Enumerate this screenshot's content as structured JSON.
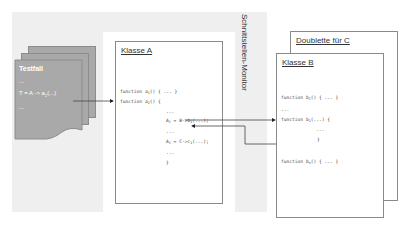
{
  "diagram": {
    "monitor_label": "Schnittstellen-Monitor",
    "testfall": {
      "title": "Testfall",
      "lines": [
        "...",
        "T = A -> a",
        "2",
        "(...)",
        "..."
      ]
    },
    "klasse_a": {
      "title": "Klasse A",
      "code": {
        "f1": "function a",
        "f1_sub": "1",
        "f1_rest": "() { ... }",
        "f2": "function a",
        "f2_sub": "2",
        "f2_rest": "() {",
        "dots1": "...",
        "l1a": "A",
        "l1_sub": "1",
        "l1b": " = B->b",
        "l1_sub2": "1",
        "l1c": "(...);",
        "dots2": "...",
        "l2a": "A",
        "l2_sub": "1",
        "l2b": " = C->c",
        "l2_sub2": "1",
        "l2c": "(...);",
        "dots3": "...",
        "close": "}"
      }
    },
    "doublette": {
      "title": "Doublette für C"
    },
    "klasse_b": {
      "title": "Klasse B",
      "code": {
        "f1": "function b",
        "f1_sub": "1",
        "f1_rest": "() { ... }",
        "dots1": "...",
        "f2": "function b",
        "f2_sub": "1",
        "f2_rest": "(...) {",
        "dots2": "...",
        "close": "}",
        "f3": "function b",
        "f3_sub": "n",
        "f3_rest": "() { ... }"
      }
    }
  }
}
